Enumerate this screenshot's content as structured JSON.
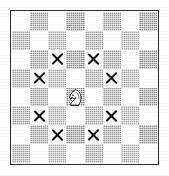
{
  "diagram": {
    "caption": "White knight on d4 with its eight legal moves marked by X",
    "board": {
      "files": [
        "a",
        "b",
        "c",
        "d",
        "e",
        "f",
        "g",
        "h"
      ],
      "ranks": [
        "8",
        "7",
        "6",
        "5",
        "4",
        "3",
        "2",
        "1"
      ],
      "light_square_color": "#ffffff",
      "dark_square_color": "#a7a7a7",
      "border_color": "#2e2e2e",
      "marker_color": "#111111",
      "squares": [
        {
          "id": "a8",
          "shade": "light"
        },
        {
          "id": "b8",
          "shade": "dark"
        },
        {
          "id": "c8",
          "shade": "light"
        },
        {
          "id": "d8",
          "shade": "dark"
        },
        {
          "id": "e8",
          "shade": "light"
        },
        {
          "id": "f8",
          "shade": "dark"
        },
        {
          "id": "g8",
          "shade": "light"
        },
        {
          "id": "h8",
          "shade": "dark"
        },
        {
          "id": "a7",
          "shade": "dark"
        },
        {
          "id": "b7",
          "shade": "light"
        },
        {
          "id": "c7",
          "shade": "dark"
        },
        {
          "id": "d7",
          "shade": "light"
        },
        {
          "id": "e7",
          "shade": "dark"
        },
        {
          "id": "f7",
          "shade": "light"
        },
        {
          "id": "g7",
          "shade": "dark"
        },
        {
          "id": "h7",
          "shade": "light"
        },
        {
          "id": "a6",
          "shade": "light"
        },
        {
          "id": "b6",
          "shade": "dark"
        },
        {
          "id": "c6",
          "shade": "light",
          "marker": "X"
        },
        {
          "id": "d6",
          "shade": "dark"
        },
        {
          "id": "e6",
          "shade": "light",
          "marker": "X"
        },
        {
          "id": "f6",
          "shade": "dark"
        },
        {
          "id": "g6",
          "shade": "light"
        },
        {
          "id": "h6",
          "shade": "dark"
        },
        {
          "id": "a5",
          "shade": "dark"
        },
        {
          "id": "b5",
          "shade": "light",
          "marker": "X"
        },
        {
          "id": "c5",
          "shade": "dark"
        },
        {
          "id": "d5",
          "shade": "light"
        },
        {
          "id": "e5",
          "shade": "dark"
        },
        {
          "id": "f5",
          "shade": "light",
          "marker": "X"
        },
        {
          "id": "g5",
          "shade": "dark"
        },
        {
          "id": "h5",
          "shade": "light"
        },
        {
          "id": "a4",
          "shade": "light"
        },
        {
          "id": "b4",
          "shade": "dark"
        },
        {
          "id": "c4",
          "shade": "light"
        },
        {
          "id": "d4",
          "shade": "dark",
          "piece": "white-knight"
        },
        {
          "id": "e4",
          "shade": "light"
        },
        {
          "id": "f4",
          "shade": "dark"
        },
        {
          "id": "g4",
          "shade": "light"
        },
        {
          "id": "h4",
          "shade": "dark"
        },
        {
          "id": "a3",
          "shade": "dark"
        },
        {
          "id": "b3",
          "shade": "light",
          "marker": "X"
        },
        {
          "id": "c3",
          "shade": "dark"
        },
        {
          "id": "d3",
          "shade": "light"
        },
        {
          "id": "e3",
          "shade": "dark"
        },
        {
          "id": "f3",
          "shade": "light",
          "marker": "X"
        },
        {
          "id": "g3",
          "shade": "dark"
        },
        {
          "id": "h3",
          "shade": "light"
        },
        {
          "id": "a2",
          "shade": "light"
        },
        {
          "id": "b2",
          "shade": "dark"
        },
        {
          "id": "c2",
          "shade": "light",
          "marker": "X"
        },
        {
          "id": "d2",
          "shade": "dark"
        },
        {
          "id": "e2",
          "shade": "light",
          "marker": "X"
        },
        {
          "id": "f2",
          "shade": "dark"
        },
        {
          "id": "g2",
          "shade": "light"
        },
        {
          "id": "h2",
          "shade": "dark"
        },
        {
          "id": "a1",
          "shade": "dark"
        },
        {
          "id": "b1",
          "shade": "light"
        },
        {
          "id": "c1",
          "shade": "dark"
        },
        {
          "id": "d1",
          "shade": "light"
        },
        {
          "id": "e1",
          "shade": "dark"
        },
        {
          "id": "f1",
          "shade": "light"
        },
        {
          "id": "g1",
          "shade": "dark"
        },
        {
          "id": "h1",
          "shade": "light"
        }
      ]
    },
    "pieces": [
      {
        "square": "d4",
        "piece": "white-knight",
        "glyph": "knight-icon"
      }
    ],
    "move_markers": {
      "symbol": "X",
      "squares": [
        "c6",
        "e6",
        "b5",
        "f5",
        "b3",
        "f3",
        "c2",
        "e2"
      ],
      "count": 8
    }
  }
}
